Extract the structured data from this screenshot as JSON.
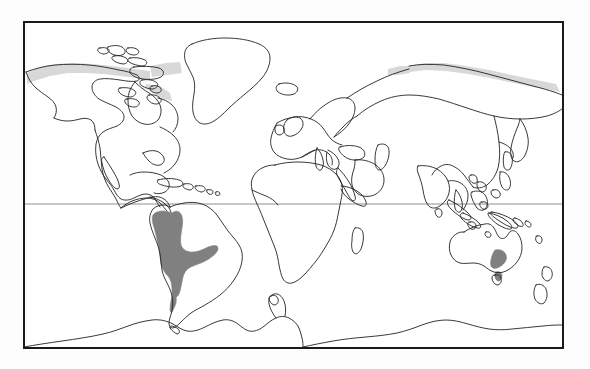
{
  "figure": {
    "type": "distribution-map",
    "projection": "equirectangular",
    "width": 590,
    "height": 369
  },
  "frame": {
    "name": "map-border",
    "x": 24,
    "y": 22,
    "width": 539,
    "height": 326,
    "stroke_color": "#1a1a1a",
    "stroke_width": 2,
    "fill_color": "#ffffff"
  },
  "graticule": {
    "equator": {
      "label": "Equator",
      "y": 204,
      "stroke_color": "#909090",
      "stroke_width": 1
    }
  },
  "colors": {
    "background": "#fdfdfd",
    "land_fill": "#ffffff",
    "coastline": "#222222",
    "range_shading": "#808080",
    "range_shading_light": "#d8d8d8",
    "border": "#1a1a1a",
    "equator_line": "#909090"
  },
  "legend": {
    "shaded_region_label": "Shaded range",
    "regions": [
      {
        "name": "southern-south-america",
        "label": "Southern South America",
        "countries": "Argentina, Uruguay, Paraguay, Bolivia, southern Brazil, Chile, southern Peru",
        "fill": "#808080"
      },
      {
        "name": "southeast-australia",
        "label": "Southeastern Australia and Tasmania",
        "countries": "Victoria, New South Wales, Tasmania",
        "fill": "#808080"
      }
    ]
  },
  "landmasses": [
    {
      "name": "north-america",
      "label": "North America"
    },
    {
      "name": "south-america",
      "label": "South America"
    },
    {
      "name": "greenland",
      "label": "Greenland"
    },
    {
      "name": "europe",
      "label": "Europe"
    },
    {
      "name": "africa",
      "label": "Africa"
    },
    {
      "name": "asia",
      "label": "Asia"
    },
    {
      "name": "australia",
      "label": "Australia"
    },
    {
      "name": "antarctica",
      "label": "Antarctica"
    },
    {
      "name": "madagascar",
      "label": "Madagascar"
    },
    {
      "name": "new-zealand",
      "label": "New Zealand"
    },
    {
      "name": "japan",
      "label": "Japan"
    },
    {
      "name": "british-isles",
      "label": "British Isles"
    },
    {
      "name": "indonesia",
      "label": "Indonesia"
    },
    {
      "name": "canadian-arctic",
      "label": "Canadian Arctic Archipelago"
    },
    {
      "name": "caribbean",
      "label": "Caribbean Islands"
    }
  ]
}
